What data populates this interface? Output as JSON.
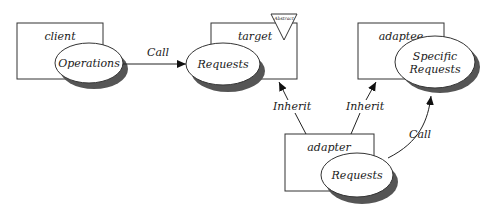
{
  "diagram": {
    "classes": {
      "client": {
        "name": "client",
        "method": "Operations"
      },
      "target": {
        "name": "target",
        "method": "Requests",
        "stereotype": "Abstract"
      },
      "adaptee": {
        "name": "adaptee",
        "method_line1": "Specific",
        "method_line2": "Requests"
      },
      "adapter": {
        "name": "adapter",
        "method": "Requests"
      }
    },
    "edges": {
      "client_to_target": "Call",
      "adapter_to_target": "Inherit",
      "adapter_to_adaptee": "Inherit",
      "adapter_to_adaptee_call": "Call"
    },
    "colors": {
      "stroke": "#333333",
      "shadow": "#666666",
      "fill": "#ffffff"
    }
  }
}
